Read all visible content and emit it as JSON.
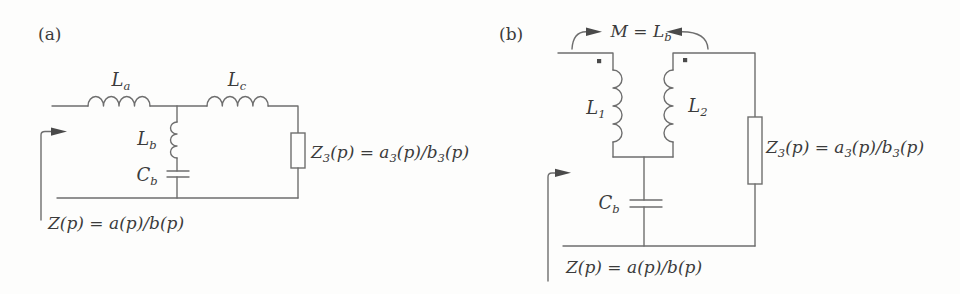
{
  "figure_a": {
    "tag": "(a)",
    "inductor_series_left": {
      "base": "L",
      "sub": "a"
    },
    "inductor_series_right": {
      "base": "L",
      "sub": "c"
    },
    "inductor_shunt": {
      "base": "L",
      "sub": "b"
    },
    "capacitor_shunt": {
      "base": "C",
      "sub": "b"
    },
    "load_eq": {
      "t1": "Z",
      "s1": "3",
      "t2": "(p) = a",
      "s2": "3",
      "t3": "(p)/b",
      "s3": "3",
      "t4": "(p)"
    },
    "input_eq": "Z(p) = a(p)/b(p)"
  },
  "figure_b": {
    "tag": "(b)",
    "mutual_eq": {
      "t1": "M = L",
      "s1": "b"
    },
    "inductor_left": {
      "base": "L",
      "sub": "1"
    },
    "inductor_right": {
      "base": "L",
      "sub": "2"
    },
    "capacitor_shunt": {
      "base": "C",
      "sub": "b"
    },
    "load_eq": {
      "t1": "Z",
      "s1": "3",
      "t2": "(p) = a",
      "s2": "3",
      "t3": "(p)/b",
      "s3": "3",
      "t4": "(p)"
    },
    "input_eq": "Z(p) = a(p)/b(p)"
  },
  "colors": {
    "line": "#6e6e6e",
    "ink": "#3b3b3b",
    "arrow": "#4a4a4a",
    "background": "#fdfdfc"
  }
}
